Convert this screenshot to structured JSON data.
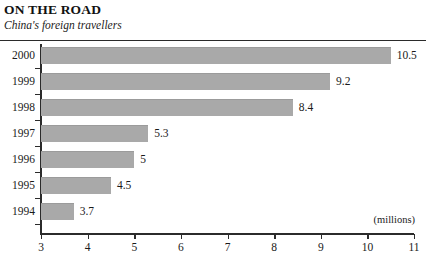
{
  "header": {
    "title": "ON THE ROAD",
    "subtitle": "China's foreign travellers"
  },
  "chart_data": {
    "type": "bar",
    "orientation": "horizontal",
    "title": "ON THE ROAD",
    "subtitle": "China's foreign travellers",
    "xlabel": "(millions)",
    "ylabel": "",
    "unit_label": "(millions)",
    "xlim": [
      3,
      11
    ],
    "xticks": [
      "3",
      "4",
      "5",
      "6",
      "7",
      "8",
      "9",
      "10",
      "11"
    ],
    "grid": false,
    "legend": null,
    "bar_color": "#a9a9a9",
    "axis_color": "#2b2b2b",
    "categories": [
      "2000",
      "1999",
      "1998",
      "1997",
      "1996",
      "1995",
      "1994"
    ],
    "values": [
      10.5,
      9.2,
      8.4,
      5.3,
      5,
      4.5,
      3.7
    ],
    "value_labels": [
      "10.5",
      "9.2",
      "8.4",
      "5.3",
      "5",
      "4.5",
      "3.7"
    ],
    "bars": [
      {
        "category": "2000",
        "value": 10.5,
        "label": "10.5"
      },
      {
        "category": "1999",
        "value": 9.2,
        "label": "9.2"
      },
      {
        "category": "1998",
        "value": 8.4,
        "label": "8.4"
      },
      {
        "category": "1997",
        "value": 5.3,
        "label": "5.3"
      },
      {
        "category": "1996",
        "value": 5,
        "label": "5"
      },
      {
        "category": "1995",
        "value": 4.5,
        "label": "4.5"
      },
      {
        "category": "1994",
        "value": 3.7,
        "label": "3.7"
      }
    ]
  }
}
